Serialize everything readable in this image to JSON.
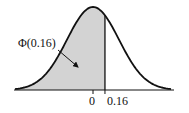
{
  "chart_data": {
    "type": "area",
    "title": "",
    "xlabel": "",
    "ylabel": "",
    "distribution": "standard normal",
    "shaded_region": {
      "from": "-inf",
      "to": 0.16
    },
    "x_ticks": [
      {
        "value": 0,
        "label": "0"
      },
      {
        "value": 0.16,
        "label": "0.16"
      }
    ],
    "annotation": {
      "text": "Φ(0.16)",
      "points_to": "shaded area"
    },
    "colors": {
      "fill": "#d3d3d3",
      "curve": "#111111"
    }
  }
}
